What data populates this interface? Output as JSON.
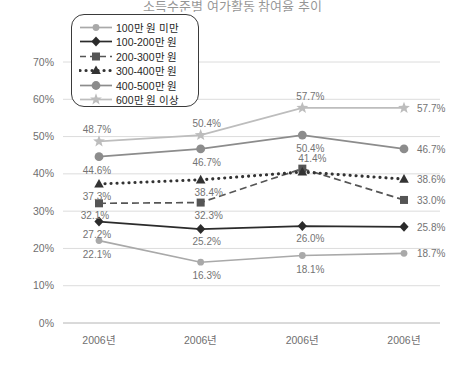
{
  "title": "소득수준별 여가활동 참여율 추이",
  "axis": {
    "y_ticks": [
      "0%",
      "10%",
      "20%",
      "30%",
      "40%",
      "50%",
      "60%",
      "70%"
    ],
    "y_min": 0,
    "y_max": 70,
    "x_labels": [
      "2006년",
      "2006년",
      "2006년",
      "2006년"
    ]
  },
  "legend": {
    "items": [
      {
        "label": "100만 원 미만",
        "marker": "circle-small",
        "line": "solid",
        "color": "#a9a9a9"
      },
      {
        "label": "100-200만 원",
        "marker": "diamond",
        "line": "solid",
        "color": "#2b2b2b"
      },
      {
        "label": "200-300만 원",
        "marker": "square",
        "line": "dashed",
        "color": "#555555"
      },
      {
        "label": "300-400만 원",
        "marker": "triangle",
        "line": "dotted",
        "color": "#333333"
      },
      {
        "label": "400-500만 원",
        "marker": "circle",
        "line": "solid",
        "color": "#8c8c8c"
      },
      {
        "label": "600만 원 이상",
        "marker": "star",
        "line": "solid",
        "color": "#bdbdbd"
      }
    ]
  },
  "chart_data": {
    "type": "line",
    "title": "소득수준별 여가활동 참여율 추이",
    "xlabel": "",
    "ylabel": "",
    "ylim": [
      0,
      70
    ],
    "grid": true,
    "legend_position": "top-left-inset",
    "categories": [
      "2006년",
      "2006년",
      "2006년",
      "2006년"
    ],
    "series": [
      {
        "name": "100만 원 미만",
        "marker": "circle-small",
        "line": "solid",
        "color": "#a9a9a9",
        "values": [
          22.1,
          16.3,
          18.1,
          18.7
        ],
        "labels": [
          "22.1%",
          "16.3%",
          "18.1%",
          "18.7%"
        ]
      },
      {
        "name": "100-200만 원",
        "marker": "diamond",
        "line": "solid",
        "color": "#2b2b2b",
        "values": [
          27.2,
          25.2,
          26.0,
          25.8
        ],
        "labels": [
          "27.2%",
          "25.2%",
          "26.0%",
          "25.8%"
        ]
      },
      {
        "name": "200-300만 원",
        "marker": "square",
        "line": "dashed",
        "color": "#555555",
        "values": [
          32.1,
          32.3,
          41.4,
          33.0
        ],
        "labels": [
          "32.1%",
          "32.3%",
          "41.4%",
          "33.0%"
        ]
      },
      {
        "name": "300-400만 원",
        "marker": "triangle",
        "line": "dotted",
        "color": "#333333",
        "values": [
          37.3,
          38.4,
          40.5,
          38.6
        ],
        "labels": [
          "37.3%",
          "38.4%",
          "",
          "38.6%"
        ]
      },
      {
        "name": "400-500만 원",
        "marker": "circle",
        "line": "solid",
        "color": "#8c8c8c",
        "values": [
          44.6,
          46.7,
          50.4,
          46.7
        ],
        "labels": [
          "44.6%",
          "46.7%",
          "50.4%",
          "46.7%"
        ]
      },
      {
        "name": "600만 원 이상",
        "marker": "star",
        "line": "solid",
        "color": "#bdbdbd",
        "values": [
          48.7,
          50.4,
          57.7,
          57.7
        ],
        "labels": [
          "48.7%",
          "50.4%",
          "57.7%",
          "57.7%"
        ]
      }
    ]
  }
}
